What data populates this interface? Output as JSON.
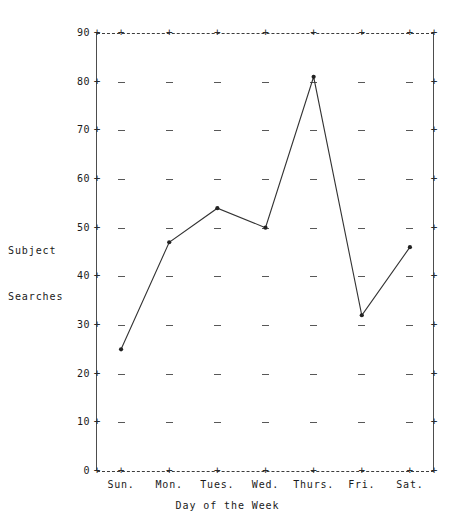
{
  "chart_data": {
    "type": "line",
    "title": "",
    "xlabel": "Day of the Week",
    "ylabel": "Subject Searches",
    "ylabel_lines": [
      "Subject",
      "Searches"
    ],
    "categories": [
      "Sun.",
      "Mon.",
      "Tues.",
      "Wed.",
      "Thurs.",
      "Fri.",
      "Sat."
    ],
    "values": [
      25,
      47,
      54,
      50,
      81,
      32,
      46
    ],
    "series": [
      {
        "name": "Subject Searches",
        "values": [
          25,
          47,
          54,
          50,
          81,
          32,
          46
        ]
      }
    ],
    "ylim": [
      0,
      90
    ],
    "ytick_step": 10,
    "yticks": [
      0,
      10,
      20,
      30,
      40,
      50,
      60,
      70,
      80,
      90
    ],
    "grid": true,
    "grid_style": "dashed-ascii",
    "legend": "none",
    "marker": "dot",
    "line_color": "#333333",
    "marker_color": "#222222",
    "axis_color": "#4d4d4d",
    "background": "#ffffff"
  },
  "style": {
    "tick_glyph": "+",
    "dash_glyph": "-"
  }
}
